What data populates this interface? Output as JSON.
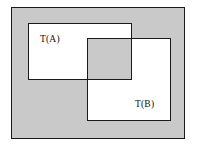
{
  "figure": {
    "universe_label": "",
    "sets": [
      {
        "id": "A",
        "label": "T(A)"
      },
      {
        "id": "B",
        "label": "T(B)"
      }
    ],
    "overlap_label": "",
    "colors": {
      "background": "#ffffff",
      "universe_fill": "#c9c9c9",
      "set_fill": "#ffffff",
      "overlap_fill": "#c9c9c9",
      "stroke": "#1a1a1a",
      "text": "#111111"
    }
  }
}
